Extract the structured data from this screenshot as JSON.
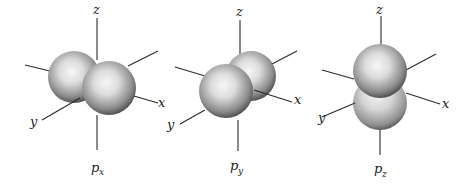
{
  "figure": {
    "orbitals": [
      {
        "id": "px",
        "label_main": "p",
        "label_sub": "x",
        "axes": {
          "z": "z",
          "y": "y",
          "x": "x"
        }
      },
      {
        "id": "py",
        "label_main": "p",
        "label_sub": "y",
        "axes": {
          "z": "z",
          "y": "y",
          "x": "x"
        }
      },
      {
        "id": "pz",
        "label_main": "p",
        "label_sub": "z",
        "axes": {
          "z": "z",
          "y": "y",
          "x": "x"
        }
      }
    ],
    "colors": {
      "background": "#ffffff",
      "axis": "#2a2a2a",
      "lobe_highlight": "#f4f4f4",
      "lobe_shadow": "#3a3a3a"
    }
  }
}
